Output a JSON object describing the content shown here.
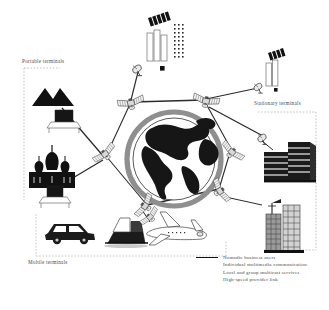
{
  "figure": {
    "kind": "satellite-communication-network-diagram",
    "background": "#ffffff",
    "ink": "#222222"
  },
  "regions": [
    {
      "key": "portable",
      "label": "Portable terminals"
    },
    {
      "key": "stationary",
      "label": "Stationary terminals"
    },
    {
      "key": "mobile",
      "label": "Mobile terminals"
    }
  ],
  "labels": {
    "portable": "Portable terminals",
    "stationary": "Stationary terminals",
    "mobile": "Mobile terminals"
  },
  "legend": {
    "items": [
      {
        "marker": "solid-line",
        "text": "Nomadic business users"
      },
      {
        "marker": "none",
        "text": "Individual multimedia communication"
      },
      {
        "marker": "none",
        "text": "Local and group multicast services"
      },
      {
        "marker": "none",
        "text": "High-speed provider link"
      }
    ]
  },
  "scene": {
    "globe": {
      "cx": 174,
      "cy": 159,
      "r": 48,
      "ring": true,
      "continents": "Americas"
    },
    "satellites": [
      {
        "id": "sat-top-left",
        "cx": 130,
        "cy": 105
      },
      {
        "id": "sat-top-right",
        "cx": 207,
        "cy": 103
      },
      {
        "id": "sat-left",
        "cx": 105,
        "cy": 153
      },
      {
        "id": "sat-right",
        "cx": 232,
        "cy": 153
      },
      {
        "id": "sat-bottom-left",
        "cx": 144,
        "cy": 207
      },
      {
        "id": "sat-bottom-right",
        "cx": 219,
        "cy": 192
      },
      {
        "id": "sat-uplink-top",
        "cx": 137,
        "cy": 68
      },
      {
        "id": "sat-uplink-right",
        "cx": 261,
        "cy": 85
      },
      {
        "id": "sat-downlink-right",
        "cx": 266,
        "cy": 138
      }
    ],
    "terminals": [
      {
        "id": "mountains",
        "icon": "mountains-icon",
        "region": "portable"
      },
      {
        "id": "laptop-upper",
        "icon": "laptop-icon",
        "region": "portable"
      },
      {
        "id": "cathedral",
        "icon": "cathedral-icon",
        "region": "portable"
      },
      {
        "id": "laptop-lower",
        "icon": "laptop-icon",
        "region": "portable"
      },
      {
        "id": "car",
        "icon": "car-icon",
        "region": "mobile"
      },
      {
        "id": "ship",
        "icon": "ship-icon",
        "region": "mobile"
      },
      {
        "id": "airplane",
        "icon": "airplane-icon",
        "region": "mobile"
      },
      {
        "id": "office-low",
        "icon": "office-block-icon",
        "region": "stationary"
      },
      {
        "id": "skyscrapers",
        "icon": "skyscraper-icon",
        "region": "stationary"
      },
      {
        "id": "towers-top",
        "icon": "tower-block-icon",
        "region": "stationary"
      },
      {
        "id": "tower-right",
        "icon": "tower-block-icon",
        "region": "stationary"
      }
    ]
  }
}
